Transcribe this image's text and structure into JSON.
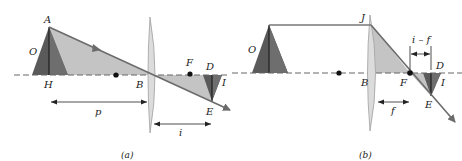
{
  "figure": {
    "colors": {
      "object_dark": "#5a5a5a",
      "object_light": "#9a9a9a",
      "shade_light": "#c4c4c4",
      "ray": "#6b6b6b",
      "axis": "#666666",
      "lens_fill": "#dcdcdc",
      "lens_edge": "#a0a0a0",
      "text": "#222222"
    },
    "panels": [
      {
        "id": "a",
        "caption": "(a)",
        "labels": {
          "A": "A",
          "O": "O",
          "H": "H",
          "B": "B",
          "F": "F",
          "D": "D",
          "I": "I",
          "E": "E"
        },
        "dimensions": {
          "object_distance": "p",
          "image_distance": "i"
        }
      },
      {
        "id": "b",
        "caption": "(b)",
        "labels": {
          "J": "J",
          "O": "O",
          "B": "B",
          "F": "F",
          "D": "D",
          "I": "I",
          "E": "E"
        },
        "dimensions": {
          "focal_length": "f",
          "image_minus_focal": "i – f"
        }
      }
    ]
  }
}
